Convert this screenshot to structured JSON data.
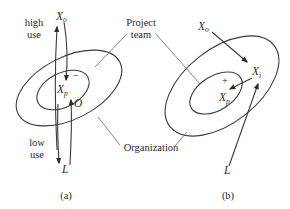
{
  "diagram": {
    "colors": {
      "line": "#3a3a3a",
      "text": "#2b2b2b",
      "background": "#ffffff"
    },
    "shared_labels": {
      "project_team_line1": "Project",
      "project_team_line2": "team",
      "organization": "Organization"
    },
    "panel_a": {
      "caption": "(a)",
      "high_use_line1": "high",
      "high_use_line2": "use",
      "low_use_line1": "low",
      "low_use_line2": "use",
      "x_o": {
        "main": "X",
        "sub": "o"
      },
      "x_p": {
        "main": "X",
        "sub": "p"
      },
      "o_label": "O",
      "l_label": "L",
      "sign": "−"
    },
    "panel_b": {
      "caption": "(b)",
      "x_o": {
        "main": "X",
        "sub": "o"
      },
      "x_i": {
        "main": "X",
        "sub": "i"
      },
      "x_p": {
        "main": "X",
        "sub": "p"
      },
      "l_label": "L",
      "sign": "+"
    }
  }
}
